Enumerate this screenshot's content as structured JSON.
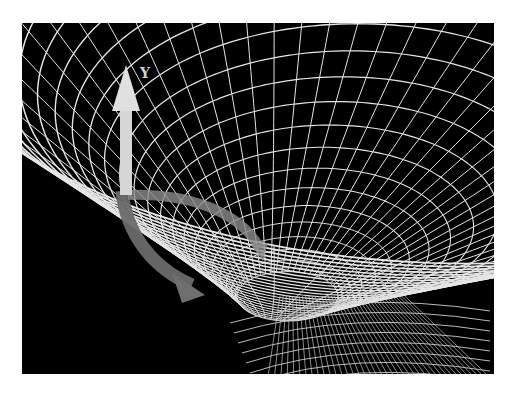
{
  "figure": {
    "title": "",
    "background": "#000000",
    "page_background": "#ffffff",
    "grid_color": "#e6e6e6",
    "frame": {
      "x": 22,
      "y": 23,
      "width": 472,
      "height": 351
    }
  },
  "funnel": {
    "throat_center": {
      "x": 268,
      "y": 268
    },
    "ring_count": 26,
    "spoke_count": 56
  },
  "axes": [
    {
      "name": "Y",
      "label": "Y",
      "color": "#d9d9d9",
      "direction": "up"
    },
    {
      "name": "horizontal-curved",
      "label": "",
      "color": "#8a8a8a",
      "direction": "right"
    },
    {
      "name": "lower-curved",
      "label": "",
      "color": "#6e6e6e",
      "direction": "down-right"
    }
  ],
  "labels": {
    "y_axis": "Y"
  }
}
